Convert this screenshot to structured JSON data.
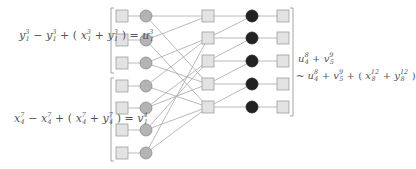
{
  "colors": {
    "square_fill": "#e3e3e3",
    "square_stroke": "#9d9d9d",
    "circle_fill": "#b4b4b4",
    "circle_stroke": "#8a8a8a",
    "black_fill": "#222222",
    "edge": "#a8a8a8",
    "bracket": "#9a9a9a",
    "text": "#555555"
  },
  "left_equations": [
    {
      "terms": [
        {
          "base": "y",
          "sup": "3",
          "sub": "1"
        },
        {
          "op": "−"
        },
        {
          "base": "y",
          "sup": "3",
          "sub": "1"
        },
        {
          "op": "+ ("
        },
        {
          "base": "x",
          "sup": "3",
          "sub": "1"
        },
        {
          "op": "+"
        },
        {
          "base": "y",
          "sup": "3",
          "sub": "1"
        },
        {
          "op": ") ="
        },
        {
          "base": "u",
          "sup": "3",
          "sub": "1"
        }
      ],
      "text": "y₁³ − y₁³ + (x₁³ + y₁³) = u₁³"
    },
    {
      "terms": [
        {
          "base": "x",
          "sup": "7",
          "sub": "4"
        },
        {
          "op": "−"
        },
        {
          "base": "x",
          "sup": "7",
          "sub": "4"
        },
        {
          "op": "+ ("
        },
        {
          "base": "x",
          "sup": "7",
          "sub": "4"
        },
        {
          "op": "+"
        },
        {
          "base": "y",
          "sup": "7",
          "sub": "4"
        },
        {
          "op": ") ="
        },
        {
          "base": "v",
          "sup": "4",
          "sub": "1"
        }
      ],
      "text": "x₄⁷ − x₄⁷ + (x₄⁷ + y₄⁷) = v₁⁴"
    }
  ],
  "right_equations": [
    {
      "terms": [
        {
          "base": "u",
          "sup": "8",
          "sub": "4"
        },
        {
          "op": "+"
        },
        {
          "base": "v",
          "sup": "9",
          "sub": "5"
        }
      ],
      "text": "u₄⁸ + v₅⁹"
    },
    {
      "terms": [
        {
          "op": "~"
        },
        {
          "base": "u",
          "sup": "8",
          "sub": "4"
        },
        {
          "op": "+"
        },
        {
          "base": "v",
          "sup": "9",
          "sub": "5"
        },
        {
          "op": "+ ("
        },
        {
          "base": "x",
          "sup": "12",
          "sub": "8"
        },
        {
          "op": "+"
        },
        {
          "base": "y",
          "sup": "12",
          "sub": "8"
        },
        {
          "op": ")"
        }
      ],
      "text": "~ u₄⁸ + v₅⁹ + (x₈¹² + y₈¹²)"
    }
  ],
  "network": {
    "left_rows_y": [
      16,
      40,
      63,
      86,
      108,
      130,
      153
    ],
    "middle_rows_y": [
      16,
      38,
      61,
      84,
      107
    ],
    "columns_x": {
      "left_square": 122,
      "left_circle": 146,
      "middle_square": 208,
      "black_circle": 252,
      "right_square": 283
    },
    "left_to_middle_edges": [
      [
        0,
        0
      ],
      [
        0,
        3
      ],
      [
        1,
        0
      ],
      [
        1,
        4
      ],
      [
        2,
        1
      ],
      [
        2,
        3
      ],
      [
        3,
        1
      ],
      [
        3,
        4
      ],
      [
        4,
        2
      ],
      [
        4,
        3
      ],
      [
        5,
        2
      ],
      [
        5,
        4
      ],
      [
        6,
        1
      ],
      [
        6,
        4
      ]
    ],
    "middle_to_black_edges": [
      [
        0,
        0
      ],
      [
        1,
        1
      ],
      [
        2,
        2
      ],
      [
        3,
        3
      ],
      [
        4,
        4
      ],
      [
        1,
        0
      ],
      [
        2,
        1
      ],
      [
        3,
        2
      ],
      [
        4,
        3
      ]
    ],
    "brackets": {
      "left_top": {
        "x": 111,
        "y1": 8,
        "y2": 73
      },
      "left_bottom": {
        "x": 111,
        "y1": 78,
        "y2": 161
      },
      "right": {
        "x": 293,
        "y1": 8,
        "y2": 116
      }
    }
  }
}
